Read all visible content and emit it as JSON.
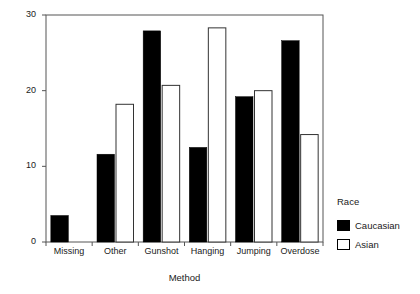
{
  "chart_data": {
    "type": "bar",
    "title": "",
    "subtitle": "",
    "xlabel": "Method",
    "ylabel": "Percentage",
    "categories": [
      "Missing",
      "Other",
      "Gunshot",
      "Hanging",
      "Jumping",
      "Overdose"
    ],
    "series": [
      {
        "name": "Caucasian",
        "color": "#000000",
        "style": "filled",
        "values": [
          3.5,
          11.6,
          27.9,
          12.5,
          19.2,
          26.6
        ]
      },
      {
        "name": "Asian",
        "color": "#ffffff",
        "style": "hollow",
        "values": [
          0,
          18.2,
          20.7,
          28.3,
          20.0,
          14.2
        ]
      }
    ],
    "ylim": [
      0,
      30
    ],
    "yticks": [
      0,
      10,
      20,
      30
    ],
    "ytick_labels": [
      "0",
      "10",
      "20",
      "30"
    ],
    "grid": false,
    "legend": {
      "title": "Race",
      "position": "right",
      "entries": [
        "Caucasian",
        "Asian"
      ]
    },
    "frame": true,
    "annotations": []
  }
}
